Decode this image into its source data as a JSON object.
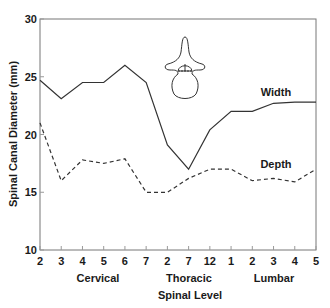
{
  "chart_data": {
    "type": "line",
    "title": "",
    "xlabel": "Spinal Level",
    "ylabel": "Spinal Canal Diameter (mm)",
    "ylim": [
      10,
      30
    ],
    "yticks": [
      10,
      15,
      20,
      25,
      30
    ],
    "grid": false,
    "categories": [
      "2",
      "3",
      "4",
      "5",
      "6",
      "7",
      "2",
      "7",
      "12",
      "1",
      "2",
      "3",
      "4",
      "5"
    ],
    "category_groups": [
      {
        "name": "Cervical",
        "levels": [
          "C2",
          "C3",
          "C4",
          "C5",
          "C6",
          "C7"
        ]
      },
      {
        "name": "Thoracic",
        "levels": [
          "T2",
          "T7",
          "T12"
        ]
      },
      {
        "name": "Lumbar",
        "levels": [
          "L1",
          "L2",
          "L3",
          "L4",
          "L5"
        ]
      }
    ],
    "series": [
      {
        "name": "Width",
        "style": "solid",
        "values": [
          24.7,
          23.1,
          24.5,
          24.5,
          26.0,
          24.5,
          19.1,
          17.0,
          20.4,
          22.0,
          22.0,
          22.7,
          22.8,
          22.8
        ]
      },
      {
        "name": "Depth",
        "style": "dashed",
        "values": [
          21.0,
          16.0,
          17.8,
          17.5,
          17.9,
          15.0,
          15.0,
          16.2,
          17.0,
          17.0,
          16.0,
          16.2,
          15.9,
          17.0
        ]
      }
    ],
    "legend": "inline labels near lines (Width above solid line, Depth above dashed line)",
    "annotations": [
      "vertebra cross-section illustration with width/depth arrows"
    ]
  },
  "labels": {
    "y_axis_title": "Spinal Canal Diameter (mm)",
    "x_axis_title": "Spinal Level",
    "width_series": "Width",
    "depth_series": "Depth",
    "group_cervical": "Cervical",
    "group_thoracic": "Thoracic",
    "group_lumbar": "Lumbar"
  },
  "colors": {
    "line": "#333333",
    "axis": "#555555",
    "text": "#1a1a1a"
  }
}
